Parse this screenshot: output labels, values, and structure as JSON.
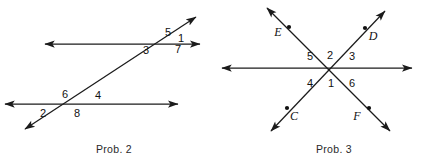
{
  "page": {
    "width": 424,
    "height": 160,
    "background": "#ffffff",
    "ink": "#1b1b1b"
  },
  "figures": [
    {
      "id": "prob-2",
      "caption": "Prob. 2",
      "caption_pos": {
        "x": 114,
        "y": 153
      },
      "description": "Two parallel horizontal lines cut by a transversal, with eight numbered angles",
      "lines": [
        {
          "name": "upper-parallel-line",
          "x1": 45,
          "y1": 44,
          "x2": 200,
          "y2": 44,
          "arrows": "both"
        },
        {
          "name": "lower-parallel-line",
          "x1": 5,
          "y1": 104,
          "x2": 178,
          "y2": 104,
          "arrows": "both"
        },
        {
          "name": "transversal-line",
          "x1": 25,
          "y1": 129,
          "x2": 196,
          "y2": 17,
          "arrows": "both"
        }
      ],
      "angle_labels": [
        {
          "name": "angle-1",
          "text": "1",
          "x": 181,
          "y": 42
        },
        {
          "name": "angle-2",
          "text": "2",
          "x": 43,
          "y": 117
        },
        {
          "name": "angle-3",
          "text": "3",
          "x": 146,
          "y": 54
        },
        {
          "name": "angle-4",
          "text": "4",
          "x": 98,
          "y": 99
        },
        {
          "name": "angle-5",
          "text": "5",
          "x": 168,
          "y": 36
        },
        {
          "name": "angle-6",
          "text": "6",
          "x": 65,
          "y": 98
        },
        {
          "name": "angle-7",
          "text": "7",
          "x": 178,
          "y": 53
        },
        {
          "name": "angle-8",
          "text": "8",
          "x": 77,
          "y": 117
        }
      ]
    },
    {
      "id": "prob-3",
      "caption": "Prob. 3",
      "caption_pos": {
        "x": 334,
        "y": 153
      },
      "description": "Three concurrent lines through one point forming six numbered angles, with labeled points C, D, E, F",
      "center": {
        "x": 331,
        "y": 68
      },
      "lines": [
        {
          "name": "horizontal-line",
          "x1": 222,
          "y1": 68,
          "x2": 412,
          "y2": 68,
          "arrows": "both"
        },
        {
          "name": "line-ef",
          "x1": 267,
          "y1": 8,
          "x2": 390,
          "y2": 131,
          "arrows": "both"
        },
        {
          "name": "line-cd",
          "x1": 271,
          "y1": 131,
          "x2": 385,
          "y2": 11,
          "arrows": "both"
        }
      ],
      "angle_labels": [
        {
          "name": "angle-1",
          "text": "1",
          "x": 331,
          "y": 86
        },
        {
          "name": "angle-2",
          "text": "2",
          "x": 330,
          "y": 58
        },
        {
          "name": "angle-3",
          "text": "3",
          "x": 351,
          "y": 59
        },
        {
          "name": "angle-4",
          "text": "4",
          "x": 310,
          "y": 86
        },
        {
          "name": "angle-5",
          "text": "5",
          "x": 310,
          "y": 59
        },
        {
          "name": "angle-6",
          "text": "6",
          "x": 351,
          "y": 86
        }
      ],
      "point_labels": [
        {
          "name": "point-e",
          "text": "E",
          "x": 278,
          "y": 36,
          "dot_x": 289,
          "dot_y": 27
        },
        {
          "name": "point-d",
          "text": "D",
          "x": 371,
          "y": 40,
          "dot_x": 365,
          "dot_y": 28
        },
        {
          "name": "point-c",
          "text": "C",
          "x": 292,
          "y": 119,
          "dot_x": 287,
          "dot_y": 108
        },
        {
          "name": "point-f",
          "text": "F",
          "x": 357,
          "y": 119,
          "dot_x": 369,
          "dot_y": 108
        }
      ]
    }
  ]
}
